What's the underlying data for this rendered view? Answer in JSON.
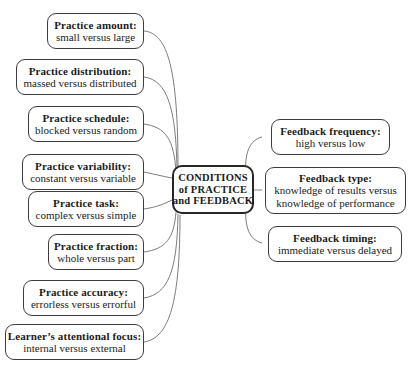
{
  "diagram": {
    "type": "radial-concept-map",
    "center": {
      "name": "conditions-of-practice-and-feedback",
      "lines": [
        "CONDITIONS",
        "of PRACTICE",
        "and FEEDBACK"
      ]
    },
    "left_branches": [
      {
        "name": "practice-amount",
        "title": "Practice amount:",
        "sub": [
          "small versus large"
        ]
      },
      {
        "name": "practice-distribution",
        "title": "Practice distribution:",
        "sub": [
          "massed versus distributed"
        ]
      },
      {
        "name": "practice-schedule",
        "title": "Practice schedule:",
        "sub": [
          "blocked versus random"
        ]
      },
      {
        "name": "practice-variability",
        "title": "Practice variability:",
        "sub": [
          "constant versus variable"
        ]
      },
      {
        "name": "practice-task",
        "title": "Practice task:",
        "sub": [
          "complex versus simple"
        ]
      },
      {
        "name": "practice-fraction",
        "title": "Practice fraction:",
        "sub": [
          "whole versus part"
        ]
      },
      {
        "name": "practice-accuracy",
        "title": "Practice accuracy:",
        "sub": [
          "errorless versus errorful"
        ]
      },
      {
        "name": "learner-attentional-focus",
        "title": "Learner’s attentional focus:",
        "sub": [
          "internal versus external"
        ]
      }
    ],
    "right_branches": [
      {
        "name": "feedback-frequency",
        "title": "Feedback frequency:",
        "sub": [
          "high versus low"
        ]
      },
      {
        "name": "feedback-type",
        "title": "Feedback type:",
        "sub": [
          "knowledge of results versus",
          "knowledge of performance"
        ]
      },
      {
        "name": "feedback-timing",
        "title": "Feedback timing:",
        "sub": [
          "immediate versus delayed"
        ]
      }
    ],
    "colors": {
      "background": "#ffffff",
      "box_border": "#3d3d3d",
      "center_border": "#272727",
      "connector": "#6e6e6e",
      "text": "#1b1b1b"
    }
  }
}
